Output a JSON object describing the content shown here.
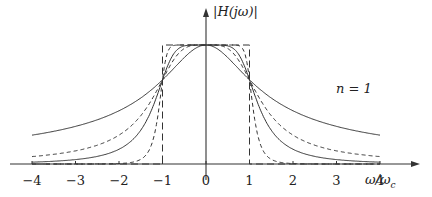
{
  "chart_data": {
    "type": "line",
    "title": "",
    "xlabel": "ω/ω_c",
    "ylabel": "|H(jω)|",
    "xlim": [
      -4,
      4
    ],
    "ylim": [
      0,
      1
    ],
    "grid": false,
    "legend": null,
    "x_ticks": [
      -4,
      -3,
      -2,
      -1,
      0,
      1,
      2,
      3,
      4
    ],
    "x_tick_labels": [
      "−4",
      "−3",
      "−2",
      "−1",
      "0",
      "1",
      "2",
      "3",
      "4"
    ],
    "annotations": [
      {
        "text": "n = 1",
        "x": 3.2,
        "y": 0.3
      }
    ],
    "series": [
      {
        "name": "n=1",
        "style": "solid",
        "formula": "1/sqrt(1+w^2)",
        "x": [
          -4,
          -3,
          -2,
          -1,
          0,
          1,
          2,
          3,
          4
        ],
        "values": [
          0.243,
          0.316,
          0.447,
          0.707,
          1,
          0.707,
          0.447,
          0.316,
          0.243
        ]
      },
      {
        "name": "n=2",
        "style": "dashed",
        "formula": "1/sqrt(1+w^4)",
        "x": [
          -4,
          -3,
          -2,
          -1,
          0,
          1,
          2,
          3,
          4
        ],
        "values": [
          0.062,
          0.11,
          0.243,
          0.707,
          1,
          0.707,
          0.243,
          0.11,
          0.062
        ]
      },
      {
        "name": "n=3",
        "style": "solid",
        "formula": "1/sqrt(1+w^6)",
        "x": [
          -4,
          -3,
          -2,
          -1,
          0,
          1,
          2,
          3,
          4
        ],
        "values": [
          0.016,
          0.037,
          0.124,
          0.707,
          1,
          0.707,
          0.124,
          0.037,
          0.016
        ]
      },
      {
        "name": "n=8",
        "style": "dashed",
        "formula": "1/sqrt(1+w^16)",
        "x": [
          -4,
          -3,
          -2,
          -1,
          0,
          1,
          2,
          3,
          4
        ],
        "values": [
          0.0,
          0.0,
          0.004,
          0.707,
          1,
          0.707,
          0.004,
          0.0,
          0.0
        ]
      },
      {
        "name": "ideal",
        "style": "long-dashed",
        "formula": "rect(|w|<=1)",
        "x": [
          -4,
          -1,
          -1,
          1,
          1,
          4
        ],
        "values": [
          0,
          0,
          1,
          1,
          0,
          0
        ]
      }
    ]
  },
  "labels": {
    "ylabel": "|H(jω)|",
    "xlabel": "ω/ω",
    "xlabel_sub": "c",
    "annotation": "n = 1",
    "ticks": [
      "−4",
      "−3",
      "−2",
      "−1",
      "0",
      "1",
      "2",
      "3",
      "4"
    ]
  }
}
